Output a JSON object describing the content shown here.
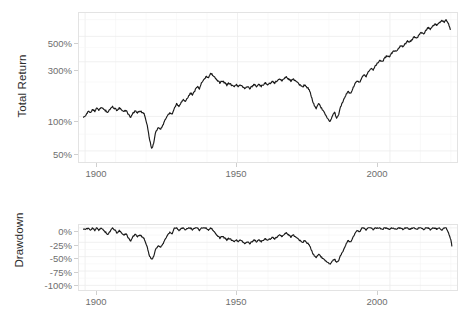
{
  "figure": {
    "background_color": "#ffffff",
    "line_color": "#1a1a1a",
    "grid_color": "#ececec",
    "panel_border_color": "#e3e3e3",
    "tick_label_color": "#6e6e6e",
    "axis_title_color": "#2b2b2b"
  },
  "panels": {
    "top": {
      "ylabel": "Total Return",
      "y_ticks": [
        "50%",
        "100%",
        "300%",
        "500%"
      ],
      "x_ticks": [
        "1900",
        "1950",
        "2000"
      ]
    },
    "bottom": {
      "ylabel": "Drawdown",
      "y_ticks": [
        "0%",
        "-25%",
        "-50%",
        "-75%",
        "-100%"
      ],
      "x_ticks": [
        "1900",
        "1950",
        "2000"
      ]
    }
  },
  "chart_data": [
    {
      "type": "line",
      "id": "total-return",
      "title": "",
      "xlabel": "",
      "ylabel": "Total Return",
      "yscale": "log",
      "ylim": [
        40,
        800
      ],
      "xlim": [
        1898,
        2022
      ],
      "ytick_values": [
        50,
        100,
        300,
        500
      ],
      "ytick_labels": [
        "50%",
        "100%",
        "300%",
        "500%"
      ],
      "xtick_values": [
        1900,
        1950,
        2000
      ],
      "xtick_labels": [
        "1900",
        "1950",
        "2000"
      ],
      "grid": true,
      "legend": "none",
      "series": [
        {
          "name": "Total Return",
          "color": "#1a1a1a",
          "x": [
            1899.5,
            1900.5,
            1901,
            1901.8,
            1902.5,
            1903.2,
            1903.8,
            1904.5,
            1905.2,
            1906,
            1906.8,
            1907.5,
            1908.2,
            1909,
            1909.8,
            1910.5,
            1911.2,
            1912,
            1912.8,
            1913.5,
            1914.2,
            1915,
            1915.8,
            1916.5,
            1917.2,
            1918,
            1918.8,
            1919.5,
            1920.2,
            1921,
            1921.8,
            1922.5,
            1923.2,
            1924,
            1924.8,
            1925.5,
            1926.2,
            1927,
            1927.8,
            1928.5,
            1929.2,
            1930,
            1930.8,
            1931.5,
            1932.2,
            1933,
            1933.8,
            1934.5,
            1935.2,
            1936,
            1936.8,
            1937.5,
            1938.2,
            1939,
            1939.8,
            1940.5,
            1941.2,
            1942,
            1942.8,
            1943.5,
            1944.2,
            1945,
            1945.8,
            1946.5,
            1947.2,
            1948,
            1948.8,
            1949.5,
            1950.2,
            1951,
            1951.8,
            1952.5,
            1953.2,
            1954,
            1954.8,
            1955.5,
            1956.2,
            1957,
            1957.8,
            1958.5,
            1959.2,
            1960,
            1960.8,
            1961.5,
            1962.2,
            1963,
            1963.8,
            1964.5,
            1965.2,
            1966,
            1966.8,
            1967.5,
            1968.2,
            1969,
            1969.8,
            1970.5,
            1971.2,
            1972,
            1972.8,
            1973.5,
            1974.2,
            1975,
            1975.8,
            1976.5,
            1977.2,
            1978,
            1978.8,
            1979.5,
            1980.2,
            1981,
            1981.8,
            1982.5,
            1983.2,
            1984,
            1984.8,
            1985.5,
            1986.2,
            1987,
            1987.8,
            1988.5,
            1989.2,
            1990,
            1990.8,
            1991.5,
            1992.2,
            1993,
            1993.8,
            1994.5,
            1995.2,
            1996,
            1996.8,
            1997.5,
            1998.2,
            1999,
            1999.8,
            2000.5,
            2001.2,
            2002,
            2002.8,
            2003.5,
            2004.2,
            2005,
            2005.8,
            2006.5,
            2007.2,
            2008,
            2008.8,
            2009.5,
            2010.2,
            2011,
            2011.8,
            2012.5,
            2013.2,
            2014,
            2014.8,
            2015.5,
            2016.2,
            2017,
            2017.8,
            2018.5,
            2019.2,
            2020,
            2020.4,
            2020.8
          ],
          "y": [
            100,
            104,
            112,
            108,
            115,
            110,
            118,
            114,
            120,
            116,
            112,
            108,
            116,
            121,
            117,
            113,
            118,
            114,
            110,
            113,
            104,
            98,
            108,
            112,
            108,
            112,
            108,
            104,
            88,
            66,
            52,
            58,
            74,
            80,
            78,
            84,
            92,
            100,
            108,
            104,
            116,
            128,
            122,
            134,
            140,
            135,
            148,
            160,
            155,
            168,
            182,
            175,
            196,
            210,
            225,
            215,
            238,
            228,
            215,
            205,
            196,
            205,
            196,
            188,
            196,
            188,
            182,
            190,
            182,
            188,
            180,
            176,
            183,
            176,
            183,
            190,
            183,
            190,
            183,
            190,
            196,
            190,
            196,
            203,
            196,
            204,
            212,
            205,
            213,
            220,
            212,
            204,
            212,
            204,
            196,
            188,
            180,
            188,
            180,
            172,
            150,
            128,
            118,
            130,
            122,
            112,
            104,
            96,
            90,
            98,
            110,
            96,
            105,
            125,
            140,
            152,
            165,
            158,
            175,
            190,
            205,
            198,
            215,
            232,
            225,
            245,
            262,
            255,
            275,
            295,
            310,
            300,
            320,
            340,
            330,
            355,
            378,
            368,
            390,
            415,
            405,
            430,
            455,
            445,
            470,
            495,
            480,
            510,
            540,
            525,
            560,
            595,
            580,
            615,
            645,
            620,
            655,
            690,
            665,
            700,
            640,
            555
          ]
        }
      ]
    },
    {
      "type": "line",
      "id": "drawdown",
      "title": "",
      "xlabel": "",
      "ylabel": "Drawdown",
      "yscale": "linear",
      "ylim": [
        -108,
        5
      ],
      "xlim": [
        1898,
        2022
      ],
      "ytick_values": [
        0,
        -25,
        -50,
        -75,
        -100
      ],
      "ytick_labels": [
        "0%",
        "-25%",
        "-50%",
        "-75%",
        "-100%"
      ],
      "xtick_values": [
        1900,
        1950,
        2000
      ],
      "xtick_labels": [
        "1900",
        "1950",
        "2000"
      ],
      "grid": true,
      "legend": "none",
      "series": [
        {
          "name": "Drawdown",
          "color": "#1a1a1a",
          "x": [
            1899.5,
            1900.5,
            1901,
            1901.8,
            1902.5,
            1903.2,
            1903.8,
            1904.5,
            1905.2,
            1906,
            1906.8,
            1907.5,
            1908.2,
            1909,
            1909.8,
            1910.5,
            1911.2,
            1912,
            1912.8,
            1913.5,
            1914.2,
            1915,
            1915.8,
            1916.5,
            1917.2,
            1918,
            1918.8,
            1919.5,
            1920.2,
            1921,
            1921.8,
            1922.5,
            1923.2,
            1924,
            1924.8,
            1925.5,
            1926.2,
            1927,
            1927.8,
            1928.5,
            1929.2,
            1930,
            1930.8,
            1931.5,
            1932.2,
            1933,
            1933.8,
            1934.5,
            1935.2,
            1936,
            1936.8,
            1937.5,
            1938.2,
            1939,
            1939.8,
            1940.5,
            1941.2,
            1942,
            1942.8,
            1943.5,
            1944.2,
            1945,
            1945.8,
            1946.5,
            1947.2,
            1948,
            1948.8,
            1949.5,
            1950.2,
            1951,
            1951.8,
            1952.5,
            1953.2,
            1954,
            1954.8,
            1955.5,
            1956.2,
            1957,
            1957.8,
            1958.5,
            1959.2,
            1960,
            1960.8,
            1961.5,
            1962.2,
            1963,
            1963.8,
            1964.5,
            1965.2,
            1966,
            1966.8,
            1967.5,
            1968.2,
            1969,
            1969.8,
            1970.5,
            1971.2,
            1972,
            1972.8,
            1973.5,
            1974.2,
            1975,
            1975.8,
            1976.5,
            1977.2,
            1978,
            1978.8,
            1979.5,
            1980.2,
            1981,
            1981.8,
            1982.5,
            1983.2,
            1984,
            1984.8,
            1985.5,
            1986.2,
            1987,
            1987.8,
            1988.5,
            1989.2,
            1990,
            1990.8,
            1991.5,
            1992.2,
            1993,
            1993.8,
            1994.5,
            1995.2,
            1996,
            1996.8,
            1997.5,
            1998.2,
            1999,
            1999.8,
            2000.5,
            2001.2,
            2002,
            2002.8,
            2003.5,
            2004.2,
            2005,
            2005.8,
            2006.5,
            2007.2,
            2008,
            2008.8,
            2009.5,
            2010.2,
            2011,
            2011.8,
            2012.5,
            2013.2,
            2014,
            2014.8,
            2015.5,
            2016.2,
            2017,
            2017.8,
            2018.5,
            2019.2,
            2020,
            2020.4,
            2020.8
          ],
          "y": [
            -1,
            -2,
            0,
            -4,
            0,
            -5,
            0,
            -4,
            0,
            -4,
            -8,
            -12,
            -6,
            0,
            -4,
            -9,
            -5,
            -9,
            -13,
            -10,
            -18,
            -23,
            -14,
            -11,
            -15,
            -12,
            -16,
            -20,
            -30,
            -47,
            -55,
            -50,
            -36,
            -31,
            -33,
            -28,
            -21,
            -14,
            -7,
            -11,
            -1,
            0,
            -5,
            0,
            0,
            -4,
            0,
            0,
            -3,
            0,
            0,
            -4,
            0,
            0,
            0,
            -5,
            0,
            -4,
            -10,
            -14,
            -18,
            -14,
            -18,
            -21,
            -18,
            -21,
            -24,
            -21,
            -24,
            -21,
            -25,
            -27,
            -24,
            -27,
            -24,
            -21,
            -24,
            -21,
            -24,
            -21,
            -19,
            -21,
            -19,
            -16,
            -19,
            -16,
            -12,
            -15,
            -12,
            -9,
            -12,
            -16,
            -12,
            -16,
            -19,
            -22,
            -26,
            -22,
            -26,
            -29,
            -38,
            -47,
            -51,
            -46,
            -49,
            -54,
            -57,
            -60,
            -63,
            -59,
            -54,
            -60,
            -56,
            -46,
            -38,
            -30,
            -22,
            -25,
            -17,
            -11,
            -4,
            -7,
            -1,
            0,
            -3,
            0,
            0,
            -3,
            0,
            0,
            0,
            -3,
            0,
            0,
            -3,
            0,
            0,
            -3,
            0,
            0,
            -3,
            0,
            0,
            -3,
            0,
            0,
            -3,
            0,
            0,
            -3,
            0,
            0,
            -3,
            0,
            0,
            -3,
            0,
            -4,
            0,
            0,
            -9,
            -21,
            -34
          ]
        }
      ]
    }
  ]
}
